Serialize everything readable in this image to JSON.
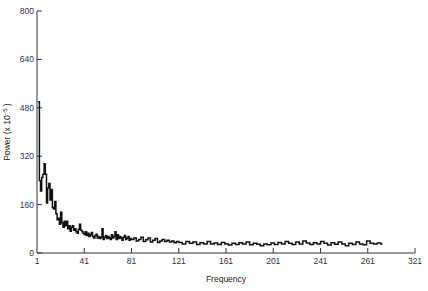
{
  "chart_data": {
    "type": "line",
    "title": "",
    "xlabel": "Frequency",
    "ylabel": "Power (x 10^-5 )",
    "ylabel_parts": {
      "main": "Power (x 10",
      "sup": "−5",
      "end": " )"
    },
    "xlim": [
      1,
      321
    ],
    "ylim": [
      0,
      800
    ],
    "grid": false,
    "legend": null,
    "x_ticks": [
      {
        "pos": 0,
        "label": "1"
      },
      {
        "pos": 1,
        "label": "41"
      },
      {
        "pos": 2,
        "label": "81"
      },
      {
        "pos": 3,
        "label": "121"
      },
      {
        "pos": 4,
        "label": "161"
      },
      {
        "pos": 5,
        "label": "201"
      },
      {
        "pos": 6,
        "label": "241"
      },
      {
        "pos": 7,
        "label": "261"
      },
      {
        "pos": 8,
        "label": "321"
      }
    ],
    "y_ticks": [
      0,
      160,
      320,
      480,
      640,
      800
    ],
    "series": [
      {
        "name": "Power spectrum",
        "style": "step",
        "x": [
          2,
          3,
          4,
          5,
          6,
          7,
          8,
          9,
          10,
          11,
          12,
          13,
          14,
          15,
          16,
          17,
          18,
          19,
          20,
          21,
          22,
          23,
          24,
          25,
          26,
          27,
          28,
          29,
          30,
          31,
          32,
          33,
          34,
          35,
          36,
          37,
          38,
          39,
          40,
          41,
          42,
          43,
          44,
          45,
          46,
          47,
          48,
          49,
          50,
          51,
          52,
          53,
          54,
          55,
          56,
          57,
          58,
          59,
          60,
          61,
          62,
          63,
          64,
          65,
          66,
          67,
          68,
          69,
          70,
          71,
          72,
          73,
          74,
          75,
          76,
          77,
          78,
          79,
          80,
          81,
          83,
          85,
          87,
          89,
          91,
          93,
          95,
          97,
          99,
          101,
          103,
          105,
          107,
          109,
          111,
          113,
          115,
          117,
          119,
          121,
          124,
          127,
          130,
          133,
          136,
          139,
          142,
          145,
          148,
          151,
          154,
          157,
          160,
          163,
          166,
          169,
          172,
          175,
          178,
          181,
          184,
          187,
          190,
          193,
          196,
          199,
          202,
          205,
          208,
          211,
          214,
          217,
          220,
          223,
          226,
          229,
          232,
          235,
          238,
          241,
          244,
          247,
          250,
          253,
          256,
          259,
          262,
          265,
          268,
          271,
          274,
          277,
          280,
          283,
          286,
          289,
          292
        ],
        "values": [
          500,
          240,
          205,
          250,
          260,
          295,
          260,
          165,
          215,
          230,
          175,
          210,
          150,
          145,
          170,
          130,
          110,
          115,
          95,
          135,
          100,
          85,
          105,
          90,
          105,
          80,
          90,
          72,
          85,
          90,
          75,
          80,
          70,
          65,
          78,
          95,
          75,
          70,
          65,
          60,
          70,
          58,
          65,
          55,
          60,
          68,
          55,
          50,
          58,
          62,
          50,
          55,
          48,
          52,
          80,
          45,
          52,
          58,
          48,
          55,
          50,
          45,
          60,
          50,
          55,
          70,
          45,
          60,
          48,
          55,
          50,
          42,
          52,
          58,
          45,
          50,
          55,
          42,
          48,
          45,
          50,
          40,
          45,
          52,
          38,
          44,
          50,
          36,
          42,
          48,
          35,
          40,
          45,
          38,
          42,
          36,
          40,
          34,
          38,
          35,
          30,
          38,
          32,
          36,
          28,
          34,
          30,
          38,
          30,
          33,
          28,
          35,
          30,
          26,
          32,
          28,
          34,
          30,
          36,
          27,
          32,
          29,
          24,
          30,
          27,
          33,
          28,
          35,
          30,
          38,
          32,
          28,
          36,
          30,
          40,
          33,
          28,
          34,
          30,
          38,
          32,
          26,
          34,
          29,
          36,
          30,
          24,
          32,
          28,
          36,
          30,
          27,
          40,
          32,
          30,
          33,
          30
        ],
        "color": "#111111"
      }
    ]
  }
}
